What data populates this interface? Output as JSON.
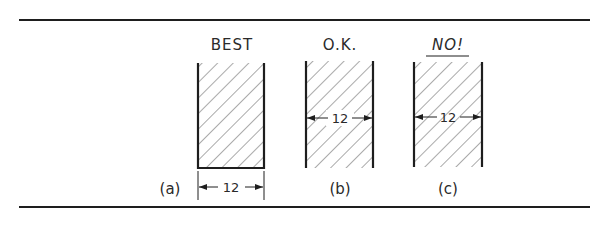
{
  "figure": {
    "type": "drafting-illustration",
    "colors": {
      "ink": "#1e1e1e",
      "text": "#2a2a2a",
      "background": "#ffffff"
    },
    "panels": [
      {
        "id": "a",
        "heading": "BEST",
        "caption": "(a)",
        "dimension": "12",
        "dimension_placement": "outside-below"
      },
      {
        "id": "b",
        "heading": "O.K.",
        "caption": "(b)",
        "dimension": "12",
        "dimension_placement": "inside-across-hatching"
      },
      {
        "id": "c",
        "heading": "NO!",
        "caption": "(c)",
        "dimension": "12",
        "dimension_placement": "inside-across-hatching-with-no-clear-space"
      }
    ]
  }
}
